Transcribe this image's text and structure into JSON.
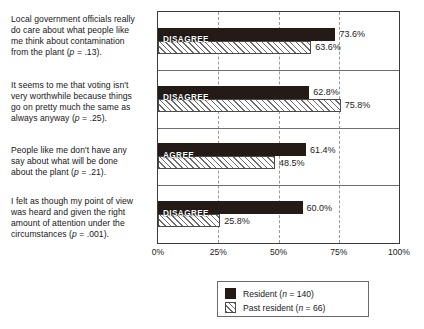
{
  "chart_data": {
    "type": "bar",
    "orientation": "horizontal",
    "title": "",
    "xlabel": "",
    "ylabel": "",
    "xlim": [
      0,
      100
    ],
    "xticks": [
      "0%",
      "25%",
      "50%",
      "75%",
      "100%"
    ],
    "xtick_values": [
      0,
      25,
      50,
      75,
      100
    ],
    "grid": true,
    "grid_axis": "x",
    "legend_position": "bottom-right",
    "categories": [
      "Local government officials really do care about what people like me think about contamination from the plant (p = .13).",
      "It seems to me that voting isn't very worthwhile because things go on pretty much the same as always anyway (p = .25).",
      "People like me don't have any say about what will be done about the plant (p = .21).",
      "I felt as though my point of view was heard and given the right amount of attention under the circumstances (p = .001)."
    ],
    "group_response_labels": [
      "DISAGREE",
      "DISAGREE",
      "AGREE",
      "DISAGREE"
    ],
    "series": [
      {
        "name": "Resident (n = 140)",
        "values": [
          73.6,
          62.8,
          61.4,
          60.0
        ]
      },
      {
        "name": "Past resident (n = 66)",
        "values": [
          63.6,
          75.8,
          48.5,
          25.8
        ]
      }
    ],
    "value_labels": [
      [
        "73.6%",
        "63.6%"
      ],
      [
        "62.8%",
        "75.8%"
      ],
      [
        "61.4%",
        "48.5%"
      ],
      [
        "60.0%",
        "25.8%"
      ]
    ],
    "colors": {
      "resident": "#241b17",
      "past_resident_fill": "#ffffff",
      "past_resident_hatch": "#6d6d6d",
      "frame": "#3a3a3a",
      "gridline": "#9a9a9a",
      "separator": "#6f6f6f",
      "text": "#171717"
    }
  },
  "statements": [
    {
      "id": "statement-1",
      "lines": [
        "Local government officials really",
        "do care about what people like",
        "me think about contamination",
        "from the plant ("
      ],
      "p_italic": "p",
      "p_tail": " = .13)."
    },
    {
      "id": "statement-2",
      "lines": [
        "It seems to me that voting isn't",
        "very worthwhile because things",
        "go on pretty much the same as",
        "always anyway ("
      ],
      "p_italic": "p",
      "p_tail": " = .25)."
    },
    {
      "id": "statement-3",
      "lines": [
        "People like me don't have any",
        "say about what will be done",
        "about the plant ("
      ],
      "p_italic": "p",
      "p_tail": " = .21)."
    },
    {
      "id": "statement-4",
      "lines": [
        "I felt as though my point of view",
        "was heard and given the right",
        "amount of attention under the",
        "circumstances ("
      ],
      "p_italic": "p",
      "p_tail": " = .001)."
    }
  ],
  "legend": {
    "items": [
      {
        "label_main": "Resident (",
        "n_italic": "n",
        "n_tail": " = 140)",
        "swatch": "solid"
      },
      {
        "label_main": "Past resident (",
        "n_italic": "n",
        "n_tail": " = 66)",
        "swatch": "hatch"
      }
    ]
  }
}
